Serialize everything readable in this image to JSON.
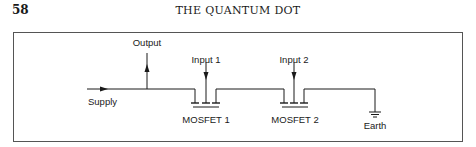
{
  "header": {
    "page_number": "58",
    "running_title": "THE QUANTUM DOT"
  },
  "figure": {
    "labels": {
      "output": "Output",
      "supply": "Supply",
      "input1": "Input 1",
      "input2": "Input 2",
      "mosfet1": "MOSFET 1",
      "mosfet2": "MOSFET 2",
      "earth": "Earth"
    },
    "colors": {
      "line": "#1a1a1a",
      "border": "#555555"
    }
  }
}
